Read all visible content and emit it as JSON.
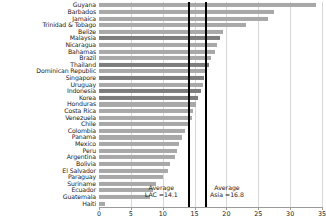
{
  "chart_data": {
    "type": "bar",
    "orientation": "horizontal",
    "title": "",
    "xlabel": "",
    "ylabel": "",
    "xlim": [
      0,
      35
    ],
    "grid": true,
    "xticks": [
      0,
      5,
      10,
      15,
      20,
      25,
      30,
      35
    ],
    "xtick_labels": [
      "0",
      "5",
      "10",
      "15",
      "20",
      "25",
      "30",
      "35"
    ],
    "categories": [
      "Guyana",
      "Barbados",
      "Jamaica",
      "Trinidad & Tobago",
      "Belize",
      "Malaysia",
      "Nicaragua",
      "Bahamas",
      "Brazil",
      "Thailand",
      "Dominican Republic",
      "Singapore",
      "Uruguay",
      "Indonesia",
      "Korea",
      "Honduras",
      "Costa Rica",
      "Venezuela",
      "Chile",
      "Colombia",
      "Panama",
      "Mexico",
      "Peru",
      "Argentina",
      "Bolivia",
      "El Salvador",
      "Paraguay",
      "Suriname",
      "Ecuador",
      "Guatemala",
      "Haiti"
    ],
    "values": [
      34.0,
      27.5,
      26.5,
      23.0,
      19.5,
      19.0,
      18.5,
      18.2,
      17.5,
      17.2,
      17.0,
      16.5,
      16.3,
      16.0,
      15.5,
      15.2,
      14.8,
      14.6,
      14.0,
      13.5,
      13.0,
      12.5,
      12.2,
      12.0,
      11.2,
      10.8,
      10.0,
      9.0,
      8.5,
      8.0,
      1.0
    ],
    "highlight_categories": [
      "Malaysia",
      "Thailand",
      "Singapore",
      "Indonesia",
      "Korea"
    ],
    "bar_color": "#a8a8a8",
    "highlight_color": "#7d7d7d",
    "reference_lines": [
      {
        "name": "average-lac",
        "value": 14.1,
        "label_line1": "Average",
        "label_line2": "LAC =14.1",
        "color": "#000000"
      },
      {
        "name": "average-asia",
        "value": 16.8,
        "label_line1": "Average",
        "label_line2": "Asia =16.8",
        "color": "#000000"
      }
    ]
  }
}
